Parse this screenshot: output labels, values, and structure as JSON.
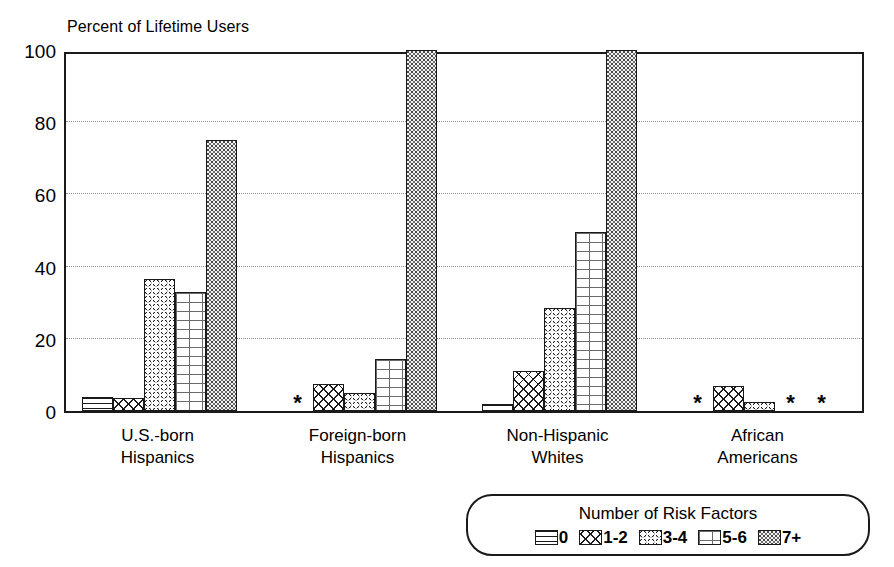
{
  "chart_data": {
    "type": "bar",
    "title": "Percent of Lifetime Users",
    "xlabel": "",
    "ylabel": "Percent of Lifetime Users",
    "ylim": [
      0,
      100
    ],
    "yticks": [
      0,
      20,
      40,
      60,
      80,
      100
    ],
    "ytick_labels": [
      "0",
      "20",
      "40",
      "60",
      "80",
      "100"
    ],
    "grid": true,
    "grid_axis": "y",
    "legend_position": "bottom-right",
    "legend_title": "Number of Risk Factors",
    "categories": [
      "U.S.-born Hispanics",
      "Foreign-born Hispanics",
      "Non-Hispanic Whites",
      "African Americans"
    ],
    "category_lines": [
      [
        "U.S.-born",
        "Hispanics"
      ],
      [
        "Foreign-born",
        "Hispanics"
      ],
      [
        "Non-Hispanic",
        "Whites"
      ],
      [
        "African",
        "Americans"
      ]
    ],
    "suppressed_marker": "*",
    "series": [
      {
        "name": "0",
        "pattern": "horizontal-lines",
        "values": [
          4,
          null,
          2,
          null
        ]
      },
      {
        "name": "1-2",
        "pattern": "diamond-crosshatch",
        "values": [
          3.5,
          7.5,
          11,
          7
        ]
      },
      {
        "name": "3-4",
        "pattern": "circles",
        "values": [
          36.5,
          5,
          28.5,
          2.5
        ]
      },
      {
        "name": "5-6",
        "pattern": "brick",
        "values": [
          33,
          14.5,
          49.5,
          null
        ]
      },
      {
        "name": "7+",
        "pattern": "stipple",
        "values": [
          75,
          100,
          100,
          null
        ]
      }
    ]
  },
  "legend": {
    "title": "Number of Risk Factors",
    "items": [
      {
        "label": "0",
        "pattern": "horizontal-lines"
      },
      {
        "label": "1-2",
        "pattern": "diamond-crosshatch"
      },
      {
        "label": "3-4",
        "pattern": "circles"
      },
      {
        "label": "5-6",
        "pattern": "brick"
      },
      {
        "label": "7+",
        "pattern": "stipple"
      }
    ]
  },
  "colors": {
    "axis": "#1a1a1a",
    "grid": "#8d8d8d",
    "background": "#ffffff",
    "bar_outline": "#1a1a1a"
  }
}
